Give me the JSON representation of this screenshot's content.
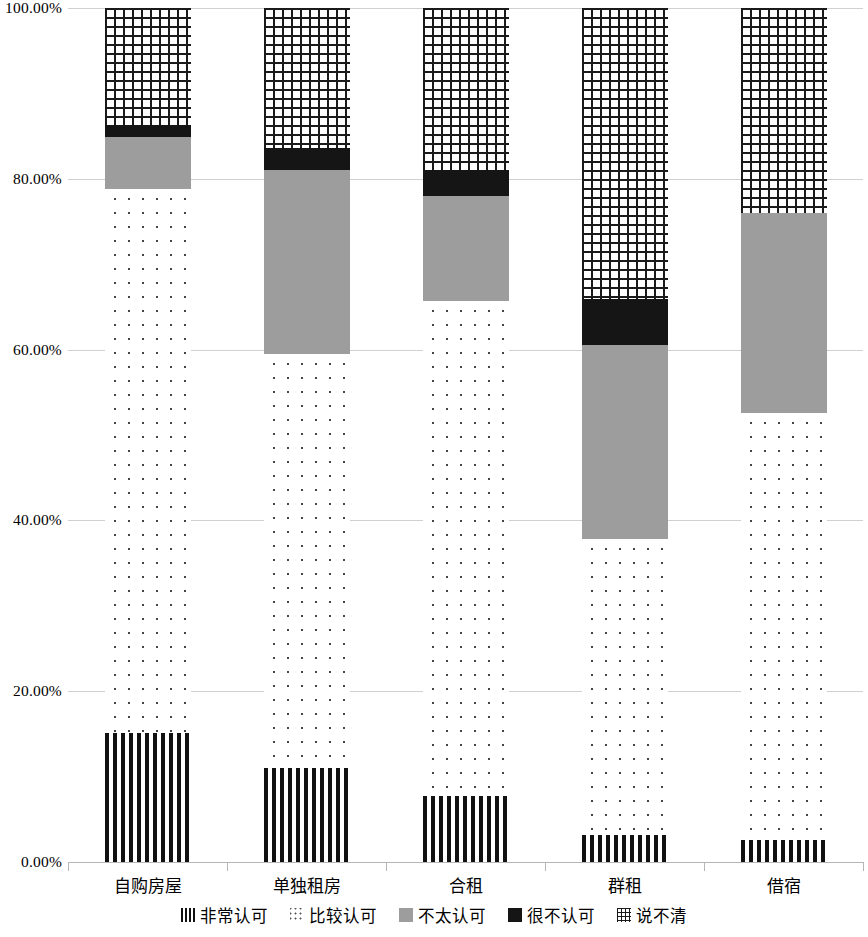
{
  "chart_data": {
    "type": "bar",
    "subtype": "stacked-100-percent",
    "title": "",
    "xlabel": "",
    "ylabel": "",
    "ylim": [
      0,
      100
    ],
    "ytick_labels": [
      "0.00%",
      "20.00%",
      "40.00%",
      "60.00%",
      "80.00%",
      "100.00%"
    ],
    "ytick_values": [
      0,
      20,
      40,
      60,
      80,
      100
    ],
    "grid": true,
    "legend_position": "bottom",
    "categories": [
      "自购房屋",
      "单独租房",
      "合租",
      "群租",
      "借宿"
    ],
    "series": [
      {
        "name": "非常认可",
        "pattern": "vertical-stripes",
        "values": [
          15.15,
          11.0,
          7.7,
          3.2,
          2.6
        ]
      },
      {
        "name": "比较认可",
        "pattern": "dots",
        "values": [
          63.64,
          48.5,
          57.98,
          34.62,
          50.0
        ]
      },
      {
        "name": "不太认可",
        "pattern": "solid-gray",
        "values": [
          6.06,
          21.5,
          12.32,
          22.68,
          23.4
        ]
      },
      {
        "name": "很不认可",
        "pattern": "solid-black",
        "values": [
          1.5,
          2.6,
          3.0,
          5.4,
          0.0
        ]
      },
      {
        "name": "说不清",
        "pattern": "grid",
        "values": [
          13.65,
          16.4,
          19.0,
          34.1,
          24.0
        ]
      }
    ],
    "data_labels": [
      {
        "category": "自购房屋",
        "series": "比较认可",
        "text": "63.64%"
      },
      {
        "category": "单独租房",
        "series": "比较认可",
        "text": "48.50%"
      },
      {
        "category": "合租",
        "series": "比较认可",
        "text": "57.98%"
      },
      {
        "category": "群租",
        "series": "比较认可",
        "text": "34.62%"
      },
      {
        "category": "借宿",
        "series": "比较认可",
        "text": "50.00%"
      }
    ],
    "colors": {
      "stripe": "#111111",
      "dots": "#444444",
      "gray": "#9d9d9d",
      "black": "#151515",
      "grid_pattern": "#1a1a1a",
      "gridline": "#d0d0d0",
      "axis": "#b5b5b5",
      "background": "#ffffff"
    }
  }
}
